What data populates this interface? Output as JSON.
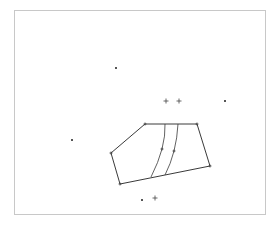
{
  "frame": {
    "x": 14,
    "y": 10,
    "width": 251,
    "height": 204,
    "stroke": "#c8c8c8"
  },
  "colors": {
    "line": "#3a3a3a",
    "point": "#555555",
    "plus": "#444444"
  },
  "polygon": [
    [
      145,
      124
    ],
    [
      197,
      124
    ],
    [
      210,
      166
    ],
    [
      120,
      184
    ],
    [
      111,
      153
    ]
  ],
  "curves": [
    [
      [
        165,
        124
      ],
      [
        162,
        149
      ],
      [
        151,
        177
      ]
    ],
    [
      [
        178,
        124
      ],
      [
        174,
        151
      ],
      [
        165,
        175
      ]
    ]
  ],
  "vertex_markers": [
    [
      145,
      124
    ],
    [
      197,
      124
    ],
    [
      210,
      166
    ],
    [
      120,
      184
    ],
    [
      111,
      153
    ],
    [
      162,
      149
    ],
    [
      174,
      151
    ]
  ],
  "scatter_points": [
    [
      116,
      68
    ],
    [
      225,
      101
    ],
    [
      72,
      140
    ],
    [
      142,
      200
    ]
  ],
  "plus_markers": [
    [
      166,
      101
    ],
    [
      179,
      101
    ],
    [
      155,
      198
    ]
  ]
}
